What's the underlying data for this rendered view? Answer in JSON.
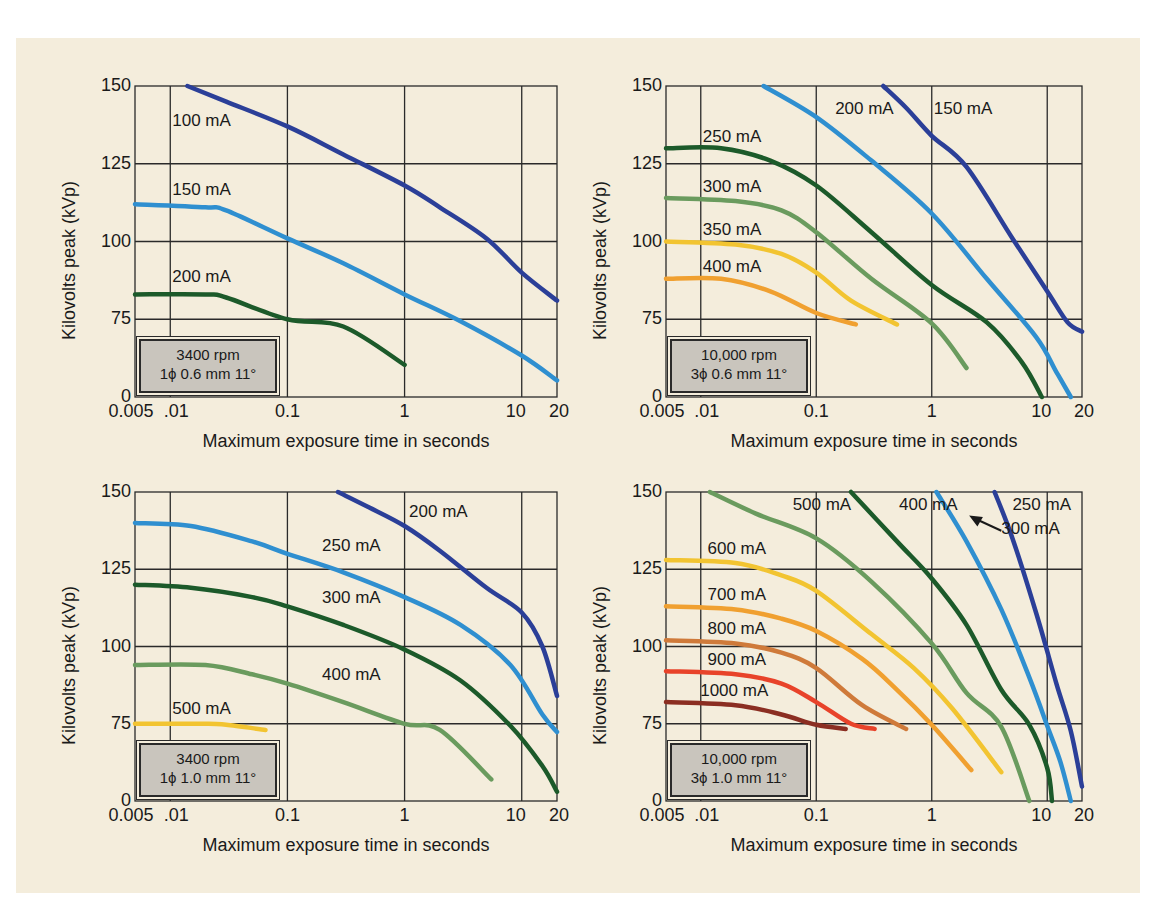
{
  "panel": {
    "background": "#f4eddc"
  },
  "chart_data": [
    {
      "id": "tl",
      "type": "line",
      "title": "",
      "xlabel": "Maximum exposure time in seconds",
      "ylabel": "Kilovolts peak (kVp)",
      "xscale": "log",
      "xlim": [
        0.005,
        20
      ],
      "ylim": [
        0,
        150
      ],
      "x_ticks": [
        "0.005",
        ".01",
        "0.1",
        "1",
        "10",
        "20"
      ],
      "y_ticks": [
        "0",
        "75",
        "100",
        "125",
        "150"
      ],
      "grid": true,
      "spec_box": {
        "line1": "3400 rpm",
        "line2": "1ϕ 0.6 mm 11°"
      },
      "series": [
        {
          "name": "100 mA",
          "color": "#2b3f98",
          "x": [
            0.014,
            0.03,
            0.1,
            0.3,
            1,
            2,
            5,
            10,
            20
          ],
          "y": [
            150,
            145,
            137,
            128,
            118,
            111,
            101,
            90,
            81
          ],
          "label_pos": [
            0.01,
            138
          ]
        },
        {
          "name": "150 mA",
          "color": "#2f8fd0",
          "x": [
            0.005,
            0.02,
            0.03,
            0.1,
            0.3,
            1,
            3,
            10,
            20
          ],
          "y": [
            112,
            111,
            110,
            101,
            93,
            83,
            73,
            40,
            16
          ],
          "label_pos": [
            0.01,
            116
          ]
        },
        {
          "name": "200 mA",
          "color": "#1c5a2a",
          "x": [
            0.005,
            0.02,
            0.03,
            0.1,
            0.3,
            1
          ],
          "y": [
            83,
            83,
            82,
            75,
            68,
            31
          ],
          "label_pos": [
            0.01,
            88
          ]
        }
      ]
    },
    {
      "id": "tr",
      "type": "line",
      "title": "",
      "xlabel": "Maximum exposure time in seconds",
      "ylabel": "Kilovolts peak (kVp)",
      "xscale": "log",
      "xlim": [
        0.005,
        20
      ],
      "ylim": [
        0,
        150
      ],
      "x_ticks": [
        "0.005",
        ".01",
        "0.1",
        "1",
        "10",
        "20"
      ],
      "y_ticks": [
        "0",
        "75",
        "100",
        "125",
        "150"
      ],
      "grid": true,
      "spec_box": {
        "line1": "10,000 rpm",
        "line2": "3ϕ 0.6 mm 11°"
      },
      "series": [
        {
          "name": "150 mA",
          "color": "#2b3f98",
          "x": [
            0.38,
            0.6,
            1,
            2,
            5,
            10,
            15,
            20
          ],
          "y": [
            150,
            143,
            134,
            124,
            101,
            84,
            72,
            63
          ],
          "label_pos": [
            1.0,
            142
          ]
        },
        {
          "name": "200 mA",
          "color": "#2f8fd0",
          "x": [
            0.035,
            0.1,
            0.3,
            1,
            3,
            8,
            12,
            16
          ],
          "y": [
            150,
            140,
            126,
            109,
            88,
            58,
            24,
            0
          ],
          "label_pos": [
            0.14,
            142
          ]
        },
        {
          "name": "250 mA",
          "color": "#1c5a2a",
          "x": [
            0.005,
            0.015,
            0.04,
            0.1,
            0.3,
            1,
            3,
            6,
            9
          ],
          "y": [
            130,
            130,
            126,
            118,
            103,
            86,
            72,
            34,
            0
          ],
          "label_pos": [
            0.01,
            133
          ]
        },
        {
          "name": "300 mA",
          "color": "#6a9b5e",
          "x": [
            0.005,
            0.02,
            0.05,
            0.1,
            0.3,
            1,
            2
          ],
          "y": [
            114,
            113,
            110,
            103,
            88,
            71,
            28
          ],
          "label_pos": [
            0.01,
            117
          ]
        },
        {
          "name": "350 mA",
          "color": "#f2c431",
          "x": [
            0.005,
            0.02,
            0.05,
            0.1,
            0.2,
            0.5
          ],
          "y": [
            100,
            99,
            96,
            90,
            81,
            70
          ],
          "label_pos": [
            0.01,
            103
          ]
        },
        {
          "name": "400 mA",
          "color": "#f0a030",
          "x": [
            0.005,
            0.015,
            0.04,
            0.1,
            0.22
          ],
          "y": [
            88,
            88,
            84,
            77,
            70
          ],
          "label_pos": [
            0.01,
            91
          ]
        }
      ]
    },
    {
      "id": "bl",
      "type": "line",
      "title": "",
      "xlabel": "Maximum exposure time in seconds",
      "ylabel": "Kilovolts peak (kVp)",
      "xscale": "log",
      "xlim": [
        0.005,
        20
      ],
      "ylim": [
        0,
        150
      ],
      "x_ticks": [
        "0.005",
        ".01",
        "0.1",
        "1",
        "10",
        "20"
      ],
      "y_ticks": [
        "0",
        "75",
        "100",
        "125",
        "150"
      ],
      "grid": true,
      "spec_box": {
        "line1": "3400 rpm",
        "line2": "1ϕ 1.0 mm 11°"
      },
      "series": [
        {
          "name": "200 mA",
          "color": "#2b3f98",
          "x": [
            0.27,
            0.5,
            1,
            2,
            5,
            10,
            15,
            20
          ],
          "y": [
            150,
            145,
            139,
            131,
            119,
            111,
            100,
            84
          ],
          "label_pos": [
            1.05,
            143
          ]
        },
        {
          "name": "250 mA",
          "color": "#2f8fd0",
          "x": [
            0.005,
            0.015,
            0.05,
            0.1,
            0.3,
            1,
            3,
            8,
            15,
            20
          ],
          "y": [
            140,
            139,
            134,
            130,
            124,
            116,
            107,
            94,
            78,
            67
          ],
          "label_pos": [
            0.19,
            132
          ]
        },
        {
          "name": "300 mA",
          "color": "#1c5a2a",
          "x": [
            0.005,
            0.015,
            0.05,
            0.1,
            0.3,
            1,
            3,
            8,
            15,
            20
          ],
          "y": [
            120,
            119,
            116,
            113,
            107,
            99,
            89,
            73,
            34,
            9
          ],
          "label_pos": [
            0.19,
            115
          ]
        },
        {
          "name": "400 mA",
          "color": "#6a9b5e",
          "x": [
            0.005,
            0.02,
            0.05,
            0.1,
            0.3,
            1,
            2,
            5.5
          ],
          "y": [
            94,
            94,
            91,
            88,
            82,
            75,
            69,
            21
          ],
          "label_pos": [
            0.19,
            90
          ]
        },
        {
          "name": "500 mA",
          "color": "#f2c431",
          "x": [
            0.005,
            0.02,
            0.03,
            0.065
          ],
          "y": [
            75,
            75,
            74,
            69
          ],
          "label_pos": [
            0.01,
            79
          ]
        }
      ]
    },
    {
      "id": "br",
      "type": "line",
      "title": "",
      "xlabel": "Maximum exposure time in seconds",
      "ylabel": "Kilovolts peak (kVp)",
      "xscale": "log",
      "xlim": [
        0.005,
        20
      ],
      "ylim": [
        0,
        150
      ],
      "x_ticks": [
        "0.005",
        ".01",
        "0.1",
        "1",
        "10",
        "20"
      ],
      "y_ticks": [
        "0",
        "75",
        "100",
        "125",
        "150"
      ],
      "grid": true,
      "spec_box": {
        "line1": "10,000 rpm",
        "line2": "3ϕ 1.0 mm 11°"
      },
      "annotation": {
        "text": "300 mA",
        "arrow_to": [
          2.2,
          142
        ]
      },
      "series": [
        {
          "name": "250 mA",
          "color": "#2b3f98",
          "x": [
            3.5,
            5,
            8,
            12,
            16,
            20
          ],
          "y": [
            150,
            135,
            111,
            88,
            68,
            14
          ],
          "label_pos": [
            4.8,
            145
          ]
        },
        {
          "name": "300 mA",
          "color": "#2f8fd0",
          "x": [
            1.1,
            2,
            4,
            7,
            10,
            13,
            16
          ],
          "y": [
            150,
            134,
            112,
            90,
            73,
            38,
            0
          ],
          "label_pos": null
        },
        {
          "name": "400 mA",
          "color": "#1c5a2a",
          "x": [
            0.2,
            0.5,
            1,
            2,
            4,
            7,
            10,
            11
          ],
          "y": [
            150,
            134,
            122,
            107,
            86,
            74,
            32,
            0
          ],
          "label_pos": [
            0.5,
            145
          ]
        },
        {
          "name": "500 mA",
          "color": "#6a9b5e",
          "x": [
            0.012,
            0.03,
            0.1,
            0.3,
            1,
            2,
            4,
            7
          ],
          "y": [
            150,
            143,
            135,
            121,
            101,
            85,
            72,
            0
          ],
          "label_pos": [
            0.06,
            145
          ]
        },
        {
          "name": "600 mA",
          "color": "#f2c431",
          "x": [
            0.005,
            0.02,
            0.05,
            0.1,
            0.3,
            0.7,
            1.5,
            4
          ],
          "y": [
            128,
            127,
            123,
            118,
            104,
            93,
            80,
            28
          ],
          "label_pos": [
            0.011,
            131
          ]
        },
        {
          "name": "700 mA",
          "color": "#f0a030",
          "x": [
            0.005,
            0.02,
            0.05,
            0.1,
            0.25,
            0.5,
            1,
            2.2
          ],
          "y": [
            113,
            112,
            109,
            105,
            96,
            86,
            74,
            30
          ],
          "label_pos": [
            0.011,
            116
          ]
        },
        {
          "name": "800 mA",
          "color": "#cf7a3a",
          "x": [
            0.005,
            0.02,
            0.05,
            0.1,
            0.25,
            0.6
          ],
          "y": [
            102,
            101,
            98,
            93,
            81,
            70
          ],
          "label_pos": [
            0.011,
            105
          ]
        },
        {
          "name": "900 mA",
          "color": "#e8432a",
          "x": [
            0.005,
            0.02,
            0.05,
            0.1,
            0.2,
            0.32
          ],
          "y": [
            92,
            91,
            88,
            82,
            75,
            70
          ],
          "label_pos": [
            0.011,
            95
          ]
        },
        {
          "name": "1000 mA",
          "color": "#8b2e22",
          "x": [
            0.005,
            0.02,
            0.05,
            0.1,
            0.18
          ],
          "y": [
            82,
            81,
            78,
            74,
            70
          ],
          "label_pos": [
            0.0095,
            85
          ]
        }
      ]
    }
  ]
}
